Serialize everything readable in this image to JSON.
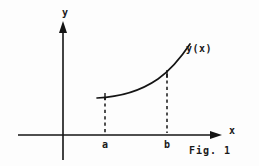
{
  "figure": {
    "caption": "Fig. 1",
    "axes": {
      "y_label": "y",
      "x_label": "x",
      "origin_x": 63,
      "origin_y": 135
    },
    "curve": {
      "label": "y(x)",
      "shape": "convex-increasing",
      "stroke_color": "#141414",
      "path": "M 97,98 C 120,97 142,90 158,79 C 172,69 182,56 190,44"
    },
    "markers": [
      {
        "name": "a",
        "tick_label": "a",
        "x": 105,
        "curve_y": 97,
        "axis_y": 135,
        "style": "dashed"
      },
      {
        "name": "b",
        "tick_label": "b",
        "x": 167,
        "curve_y": 72,
        "axis_y": 135,
        "style": "dashed"
      }
    ],
    "colors": {
      "ink": "#141414",
      "background": "#fdfdfd"
    }
  }
}
